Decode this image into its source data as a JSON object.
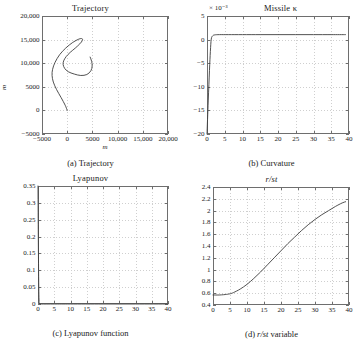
{
  "figure": {
    "background": "#ffffff",
    "curve_color": "#3d3d3d",
    "grid_color": "#cfcfcf",
    "frame_color": "#6e6e6e"
  },
  "chart_data": [
    {
      "id": "a",
      "type": "line",
      "title": "Trajectory",
      "caption": "(a) Trajectory",
      "xlabel": "m",
      "ylabel": "m",
      "xlim": [
        -5000,
        20000
      ],
      "ylim": [
        -5000,
        20000
      ],
      "xticks": [
        -5000,
        0,
        5000,
        10000,
        15000,
        20000
      ],
      "xticklabels": [
        "−5000",
        "0",
        "5000",
        "10,000",
        "15,000",
        "20,000"
      ],
      "yticks": [
        -5000,
        0,
        5000,
        10000,
        15000,
        20000
      ],
      "yticklabels": [
        "−5000",
        "0",
        "5000",
        "10,000",
        "15,000",
        "20,000"
      ],
      "grid": true,
      "legend": null,
      "series": [
        {
          "name": "trajectory",
          "comment": "closed hook / spiral path in the x-y plane",
          "x": [
            0,
            -400,
            -1200,
            -2100,
            -2750,
            -3000,
            -2900,
            -2400,
            -1500,
            -300,
            1100,
            2300,
            2950,
            3000,
            2500,
            1600,
            600,
            -200,
            -700,
            -800,
            -500,
            200,
            1400,
            2700,
            3900,
            4700,
            4950,
            4850,
            4550
          ],
          "y": [
            0,
            1100,
            2700,
            4400,
            6000,
            7400,
            8700,
            10200,
            11800,
            13200,
            14400,
            15100,
            15200,
            14800,
            14100,
            13200,
            12300,
            11400,
            10500,
            9700,
            8900,
            8200,
            7700,
            7400,
            7600,
            8400,
            9400,
            10400,
            11300
          ]
        }
      ]
    },
    {
      "id": "b",
      "type": "line",
      "title": "Missile κ",
      "caption": "(b) Curvature",
      "exponent_label": "× 10⁻³",
      "xlabel": "",
      "ylabel": "",
      "xlim": [
        0,
        40
      ],
      "ylim": [
        -20,
        5
      ],
      "xticks": [
        0,
        5,
        10,
        15,
        20,
        25,
        30,
        35,
        40
      ],
      "xticklabels": [
        "0",
        "5",
        "10",
        "15",
        "20",
        "25",
        "30",
        "35",
        "40"
      ],
      "yticks": [
        -20,
        -15,
        -10,
        -5,
        0,
        5
      ],
      "yticklabels": [
        "−20",
        "−15",
        "−10",
        "−5",
        "0",
        "5"
      ],
      "grid": true,
      "legend": null,
      "series": [
        {
          "name": "missile-curvature",
          "comment": "starts at -20e-3, rises almost vertically to ~1e-3 then flat",
          "x": [
            0,
            0.35,
            0.7,
            0.95,
            1.2,
            1.6,
            2.2,
            3.5,
            6,
            10,
            15,
            20,
            25,
            30,
            35,
            39
          ],
          "y": [
            -20,
            -13,
            -6.5,
            -2.5,
            0.1,
            0.8,
            1.0,
            1.05,
            1.05,
            1.05,
            1.05,
            1.05,
            1.05,
            1.05,
            1.05,
            1.05
          ]
        }
      ]
    },
    {
      "id": "c",
      "type": "line",
      "title": "Lyapunov",
      "caption": "(c) Lyapunov function",
      "xlabel": "",
      "ylabel": "",
      "xlim": [
        0,
        40
      ],
      "ylim": [
        0,
        0.35
      ],
      "xticks": [
        0,
        5,
        10,
        15,
        20,
        25,
        30,
        35,
        40
      ],
      "xticklabels": [
        "0",
        "5",
        "10",
        "15",
        "20",
        "25",
        "30",
        "35",
        "40"
      ],
      "yticks": [
        0,
        0.05,
        0.1,
        0.15,
        0.2,
        0.25,
        0.3,
        0.35
      ],
      "yticklabels": [
        "0",
        "0.05",
        "0.1",
        "0.15",
        "0.2",
        "0.25",
        "0.3",
        "0.35"
      ],
      "grid": true,
      "legend": null,
      "series": [
        {
          "name": "lyapunov",
          "comment": "drops near-vertically from 0.35 to 0 at x~0.3 then stays at 0",
          "x": [
            0,
            0.08,
            0.16,
            0.24,
            0.32,
            0.45,
            1,
            5,
            10,
            20,
            30,
            40
          ],
          "y": [
            0.35,
            0.22,
            0.12,
            0.05,
            0.012,
            0.002,
            0,
            0,
            0,
            0,
            0,
            0
          ]
        }
      ]
    },
    {
      "id": "d",
      "type": "line",
      "title": "r/st",
      "caption_prefix": "(d) ",
      "caption_italic": "r/st",
      "caption_suffix": " variable",
      "xlabel": "",
      "ylabel": "",
      "xlim": [
        0,
        40
      ],
      "ylim": [
        0.4,
        2.4
      ],
      "xticks": [
        0,
        5,
        10,
        15,
        20,
        25,
        30,
        35,
        40
      ],
      "xticklabels": [
        "0",
        "5",
        "10",
        "15",
        "20",
        "25",
        "30",
        "35",
        "40"
      ],
      "yticks": [
        0.4,
        0.6,
        0.8,
        1.0,
        1.2,
        1.4,
        1.6,
        1.8,
        2.0,
        2.2,
        2.4
      ],
      "yticklabels": [
        "0.4",
        "0.6",
        "0.8",
        "1",
        "1.2",
        "1.4",
        "1.6",
        "1.8",
        "2",
        "2.2",
        "2.4"
      ],
      "grid": true,
      "legend": null,
      "series": [
        {
          "name": "r-over-st",
          "comment": "flat ~0.57 to x=5, then smooth monotone rise to ~2.15 at x=39",
          "x": [
            0,
            2,
            4,
            5,
            6,
            8,
            10,
            12,
            14,
            16,
            18,
            20,
            22,
            24,
            26,
            28,
            30,
            32,
            34,
            36,
            38,
            39
          ],
          "y": [
            0.57,
            0.57,
            0.58,
            0.59,
            0.61,
            0.67,
            0.75,
            0.85,
            0.96,
            1.08,
            1.2,
            1.32,
            1.44,
            1.55,
            1.66,
            1.76,
            1.85,
            1.93,
            2.0,
            2.07,
            2.13,
            2.15
          ]
        }
      ]
    }
  ]
}
